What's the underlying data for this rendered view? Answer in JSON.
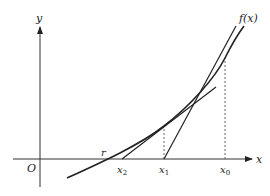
{
  "diagram": {
    "axes": {
      "x_label": "x",
      "y_label": "y",
      "origin_label": "O"
    },
    "curve_label": "f(x)",
    "points": {
      "root": "r",
      "x2": "x",
      "x2_sub": "2",
      "x1": "x",
      "x1_sub": "1",
      "x0": "x",
      "x0_sub": "0"
    },
    "colors": {
      "line": "#222222",
      "axis": "#333333",
      "dashed": "#555555",
      "background": "#ffffff"
    }
  }
}
